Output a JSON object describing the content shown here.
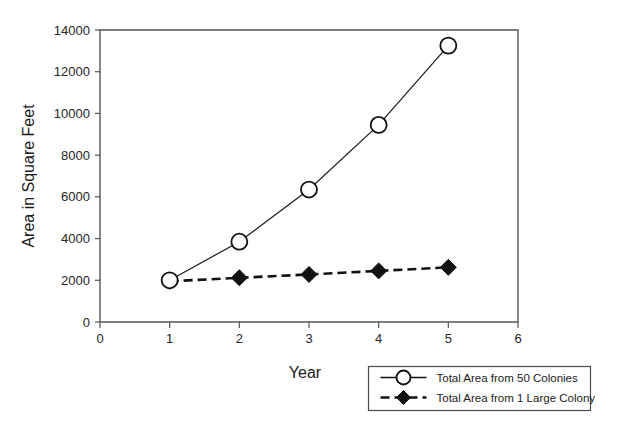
{
  "chart_data": {
    "type": "line",
    "title": "",
    "xlabel": "Year",
    "ylabel": "Area in Square Feet",
    "xlim": [
      0,
      6
    ],
    "ylim": [
      0,
      14000
    ],
    "x": [
      1,
      2,
      3,
      4,
      5
    ],
    "xticks": [
      "0",
      "1",
      "2",
      "3",
      "4",
      "5",
      "6"
    ],
    "xtick_values": [
      0,
      1,
      2,
      3,
      4,
      5,
      6
    ],
    "yticks": [
      "0",
      "2000",
      "4000",
      "6000",
      "8000",
      "10000",
      "12000",
      "14000"
    ],
    "ytick_values": [
      0,
      2000,
      4000,
      6000,
      8000,
      10000,
      12000,
      14000
    ],
    "grid": false,
    "legend_position": "below-right-outside",
    "series": [
      {
        "name": "Total Area from 50 Colonies",
        "marker": "open-circle",
        "linestyle": "solid",
        "color": "#111111",
        "values": [
          2000,
          3850,
          6350,
          9450,
          13250
        ]
      },
      {
        "name": "Total Area from 1 Large Colony",
        "marker": "filled-diamond",
        "linestyle": "dashed",
        "color": "#121212",
        "values": [
          1950,
          2120,
          2280,
          2450,
          2620
        ]
      }
    ]
  },
  "legend": {
    "entries": [
      {
        "label": "Total Area from 50 Colonies"
      },
      {
        "label": "Total Area from 1 Large Colony"
      }
    ]
  },
  "axes": {
    "x_title": "Year",
    "y_title": "Area in Square Feet"
  }
}
